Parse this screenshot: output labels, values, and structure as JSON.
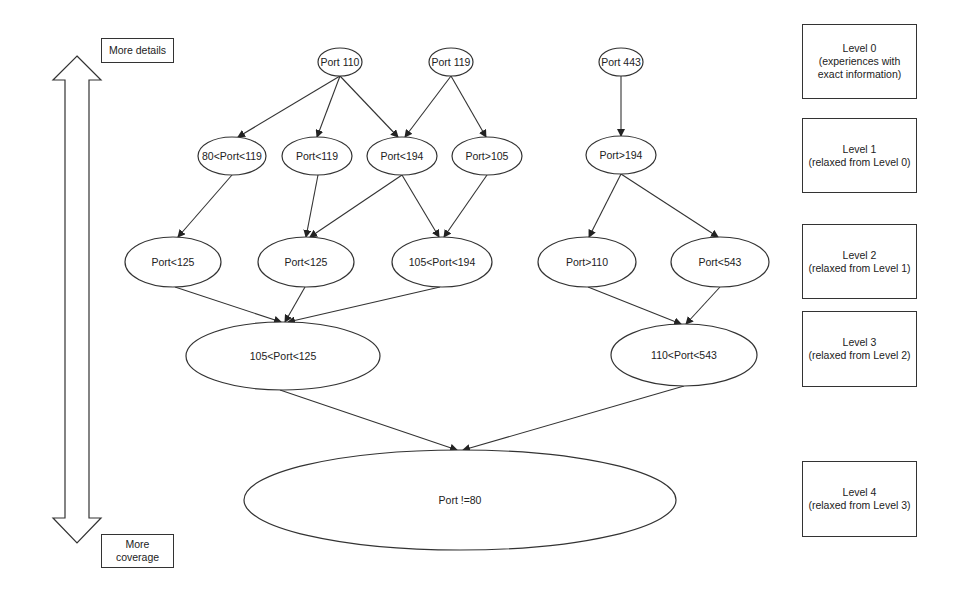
{
  "axis": {
    "top_label": "More details",
    "bottom_label_line1": "More",
    "bottom_label_line2": "coverage"
  },
  "levels": [
    {
      "title": "Level 0",
      "line2": "(experiences with",
      "line3": "exact information)"
    },
    {
      "title": "Level 1",
      "line2": "(relaxed from Level 0)",
      "line3": ""
    },
    {
      "title": "Level 2",
      "line2": "(relaxed from Level 1)",
      "line3": ""
    },
    {
      "title": "Level 3",
      "line2": "(relaxed from Level 2)",
      "line3": ""
    },
    {
      "title": "Level 4",
      "line2": "(relaxed from Level 3)",
      "line3": ""
    }
  ],
  "nodes": [
    {
      "id": "n0",
      "label": "Port 110",
      "level": 0
    },
    {
      "id": "n1",
      "label": "Port 119",
      "level": 0
    },
    {
      "id": "n2",
      "label": "Port 443",
      "level": 0
    },
    {
      "id": "n3",
      "label": "80<Port<119",
      "level": 1
    },
    {
      "id": "n4",
      "label": "Port<119",
      "level": 1
    },
    {
      "id": "n5",
      "label": "Port<194",
      "level": 1
    },
    {
      "id": "n6",
      "label": "Port>105",
      "level": 1
    },
    {
      "id": "n7",
      "label": "Port>194",
      "level": 1
    },
    {
      "id": "n8",
      "label": "Port<125",
      "level": 2
    },
    {
      "id": "n9",
      "label": "Port<125",
      "level": 2
    },
    {
      "id": "n10",
      "label": "105<Port<194",
      "level": 2
    },
    {
      "id": "n11",
      "label": "Port>110",
      "level": 2
    },
    {
      "id": "n12",
      "label": "Port<543",
      "level": 2
    },
    {
      "id": "n13",
      "label": "105<Port<125",
      "level": 3
    },
    {
      "id": "n14",
      "label": "110<Port<543",
      "level": 3
    },
    {
      "id": "n15",
      "label": "Port !=80",
      "level": 4
    }
  ],
  "edges": [
    [
      "n0",
      "n3"
    ],
    [
      "n0",
      "n4"
    ],
    [
      "n0",
      "n5"
    ],
    [
      "n1",
      "n5"
    ],
    [
      "n1",
      "n6"
    ],
    [
      "n2",
      "n7"
    ],
    [
      "n3",
      "n8"
    ],
    [
      "n4",
      "n9"
    ],
    [
      "n5",
      "n9"
    ],
    [
      "n5",
      "n10"
    ],
    [
      "n6",
      "n10"
    ],
    [
      "n7",
      "n11"
    ],
    [
      "n7",
      "n12"
    ],
    [
      "n8",
      "n13"
    ],
    [
      "n9",
      "n13"
    ],
    [
      "n10",
      "n13"
    ],
    [
      "n11",
      "n14"
    ],
    [
      "n12",
      "n14"
    ],
    [
      "n13",
      "n15"
    ],
    [
      "n14",
      "n15"
    ]
  ]
}
